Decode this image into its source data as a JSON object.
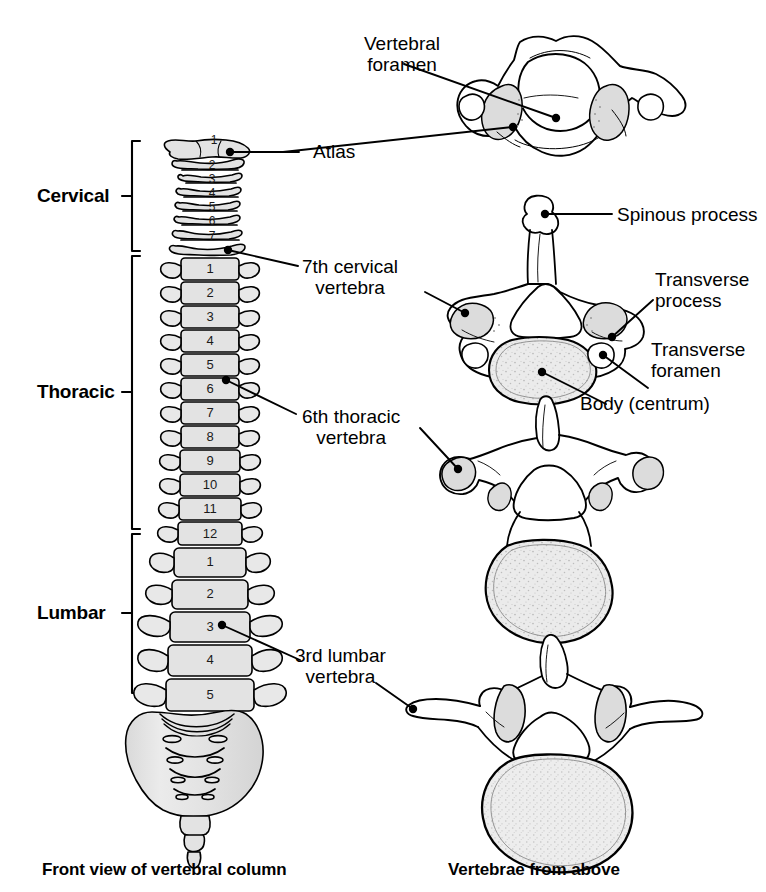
{
  "figure": {
    "title_left": "Front view of vertebral column",
    "title_right": "Vertebrae from above"
  },
  "regions": [
    {
      "name": "cervical",
      "label": "Cervical",
      "count": 7
    },
    {
      "name": "thoracic",
      "label": "Thoracic",
      "count": 12
    },
    {
      "name": "lumbar",
      "label": "Lumbar",
      "count": 5
    }
  ],
  "spine_numbers": {
    "cervical": [
      "1",
      "2",
      "3",
      "4",
      "5",
      "6",
      "7"
    ],
    "thoracic": [
      "1",
      "2",
      "3",
      "4",
      "5",
      "6",
      "7",
      "8",
      "9",
      "10",
      "11",
      "12"
    ],
    "lumbar": [
      "1",
      "2",
      "3",
      "4",
      "5"
    ]
  },
  "callouts": {
    "vertebral_foramen": "Vertebral\nforamen",
    "vertebral_foramen_line1": "Vertebral",
    "vertebral_foramen_line2": "foramen",
    "atlas": "Atlas",
    "seventh_cervical_line1": "7th cervical",
    "seventh_cervical_line2": "vertebra",
    "sixth_thoracic_line1": "6th thoracic",
    "sixth_thoracic_line2": "vertebra",
    "third_lumbar_line1": "3rd lumbar",
    "third_lumbar_line2": "vertebra",
    "spinous_process": "Spinous process",
    "transverse_process_line1": "Transverse",
    "transverse_process_line2": "process",
    "transverse_foramen_line1": "Transverse",
    "transverse_foramen_line2": "foramen",
    "body_centrum": "Body (centrum)"
  },
  "colors": {
    "ink": "#000000",
    "bone_fill": "#e3e3e3",
    "bone_fill_light": "#efefef",
    "bone_shade": "#d2d2d2",
    "background": "#ffffff"
  }
}
